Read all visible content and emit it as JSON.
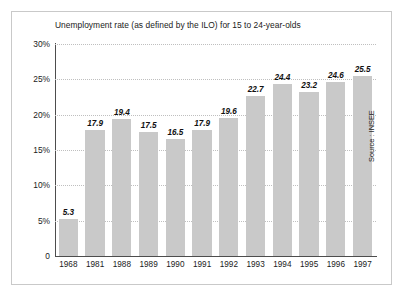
{
  "figure": {
    "title": "Unemployment rate (as defined by the ILO) for 15 to 24-year-olds",
    "source_note": "Source : INSEE",
    "bar_color": "#c9c9c9",
    "axis_color": "#4d4d4d",
    "grid_color": "#bfbfbf",
    "border_color": "#c9c9c9",
    "background": "#ffffff"
  },
  "chart_data": {
    "type": "bar",
    "title": "Unemployment rate (as defined by the ILO) for 15 to 24-year-olds",
    "xlabel": "",
    "ylabel": "",
    "ylim": [
      0,
      30
    ],
    "yticks": [
      0,
      5,
      10,
      15,
      20,
      25,
      30
    ],
    "ytick_labels": [
      "0",
      "5%",
      "10%",
      "15%",
      "20%",
      "25%",
      "30%"
    ],
    "grid": "horizontal-dotted",
    "legend": "none",
    "categories": [
      "1968",
      "1981",
      "1988",
      "1989",
      "1990",
      "1991",
      "1992",
      "1993",
      "1994",
      "1995",
      "1996",
      "1997"
    ],
    "values": [
      5.3,
      17.9,
      19.4,
      17.5,
      16.5,
      17.9,
      19.6,
      22.7,
      24.4,
      23.2,
      24.6,
      25.5
    ],
    "value_labels": [
      "5.3",
      "17.9",
      "19.4",
      "17.5",
      "16.5",
      "17.9",
      "19.6",
      "22.7",
      "24.4",
      "23.2",
      "24.6",
      "25.5"
    ],
    "annotations": [
      "Source : INSEE"
    ]
  }
}
